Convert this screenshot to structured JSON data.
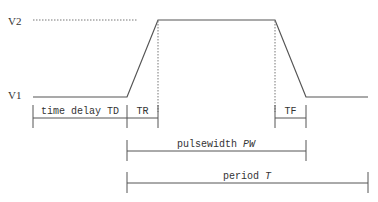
{
  "diagram": {
    "levels": {
      "high_label": "V2",
      "low_label": "V1"
    },
    "dimensions": {
      "time_delay": "time delay TD",
      "rise_time": "TR",
      "fall_time": "TF",
      "pulsewidth_prefix": "pulsewidth ",
      "pulsewidth_symbol": "PW",
      "period_prefix": "period ",
      "period_symbol": "T"
    },
    "colors": {
      "line": "#555555",
      "text": "#333333",
      "background": "#ffffff"
    }
  }
}
